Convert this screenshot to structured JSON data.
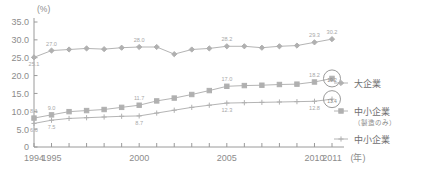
{
  "chart_data": {
    "type": "line",
    "title": "",
    "xlabel": "(年)",
    "ylabel": "(%)",
    "ylim": [
      0,
      35
    ],
    "yticks": [
      "0",
      "5.0",
      "10.0",
      "15.0",
      "20.0",
      "25.0",
      "30.0",
      "35.0"
    ],
    "x": [
      1994,
      1995,
      1996,
      1997,
      1998,
      1999,
      2000,
      2001,
      2002,
      2003,
      2004,
      2005,
      2006,
      2007,
      2008,
      2009,
      2010,
      2011
    ],
    "xticklabels": [
      "1994",
      "1995",
      "2000",
      "2005",
      "2010",
      "2011"
    ],
    "xticklabel_years": [
      1994,
      1995,
      2000,
      2005,
      2010,
      2011
    ],
    "grid": false,
    "legend_position": "right",
    "series": [
      {
        "name": "大企業",
        "marker": "diamond",
        "values": [
          25.1,
          27.0,
          27.3,
          27.6,
          27.4,
          27.8,
          28.0,
          28.0,
          26.0,
          27.3,
          27.6,
          28.2,
          28.2,
          27.8,
          28.2,
          28.4,
          29.3,
          30.2
        ],
        "labels": {
          "1994": "25.1",
          "1995": "27.0",
          "2000": "28.0",
          "2005": "28.2",
          "2010": "29.3",
          "2011": "30.2"
        }
      },
      {
        "name": "中小企業（製造のみ）",
        "marker": "square",
        "values": [
          8.1,
          9.0,
          9.9,
          10.2,
          10.5,
          11.1,
          11.7,
          12.9,
          13.7,
          14.7,
          15.8,
          17.0,
          17.2,
          17.3,
          17.5,
          17.6,
          18.2,
          19.2
        ],
        "labels": {
          "1994": "8.1",
          "1995": "9.0",
          "2000": "11.7",
          "2005": "17.0",
          "2010": "18.2",
          "2011": "19.2"
        }
      },
      {
        "name": "中小企業",
        "marker": "plus",
        "values": [
          6.6,
          7.5,
          8.0,
          8.2,
          8.4,
          8.6,
          8.7,
          9.5,
          10.3,
          11.1,
          11.7,
          12.3,
          12.4,
          12.5,
          12.6,
          12.7,
          12.8,
          13.4
        ],
        "labels": {
          "1994": "6.6",
          "1995": "7.5",
          "2000": "8.7",
          "2005": "12.3",
          "2010": "12.8",
          "2011": "13.4"
        }
      }
    ],
    "annotations": [
      {
        "text": "19.2",
        "series": "中小企業（製造のみ）",
        "year": 2011,
        "circled": true
      },
      {
        "text": "13.4",
        "series": "中小企業",
        "year": 2011,
        "circled": true
      }
    ],
    "colors": {
      "line": "#b4b4b4",
      "marker": "#b0b0b0",
      "axis": "#9a9a9a",
      "text": "#8c8c8c",
      "label": "#a8a8a8"
    }
  },
  "legend": {
    "items": [
      {
        "label": "大企業",
        "sublabel": "",
        "marker": "diamond"
      },
      {
        "label": "中小企業",
        "sublabel": "（製造のみ）",
        "marker": "square"
      },
      {
        "label": "中小企業",
        "sublabel": "",
        "marker": "plus"
      }
    ]
  },
  "axis": {
    "unit_y": "(%)",
    "unit_x": "(年)"
  }
}
